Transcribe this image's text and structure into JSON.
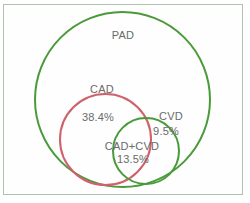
{
  "diagram": {
    "type": "venn",
    "sets": [
      {
        "name": "PAD",
        "label": "PAD",
        "color": "#4a9a3a",
        "cx": 122.5,
        "cy": 99.5,
        "r": 87.5
      },
      {
        "name": "CAD",
        "label": "CAD",
        "color": "#d0606a",
        "cx": 105.5,
        "cy": 139.5,
        "r": 45.5
      },
      {
        "name": "CVD",
        "label": "CVD",
        "color": "#4a9a3a",
        "cx": 146,
        "cy": 151,
        "r": 33
      }
    ],
    "regions": [
      {
        "sets": [
          "CAD"
        ],
        "label": "CAD",
        "value": "38.4%"
      },
      {
        "sets": [
          "CVD"
        ],
        "label": "CVD",
        "value": "9.5%"
      },
      {
        "sets": [
          "CAD",
          "CVD"
        ],
        "label": "CAD+CVD",
        "value": "13.5%"
      }
    ],
    "labels": {
      "pad": "PAD",
      "cad": "CAD",
      "cad_value": "38.4%",
      "cvd": "CVD",
      "cvd_value": "9.5%",
      "cad_cvd": "CAD+CVD",
      "cad_cvd_value": "13.5%"
    },
    "colors": {
      "green": "#4a9a3a",
      "red": "#d0606a",
      "text": "#6a6a6a",
      "border": "#b3c2b0"
    }
  }
}
